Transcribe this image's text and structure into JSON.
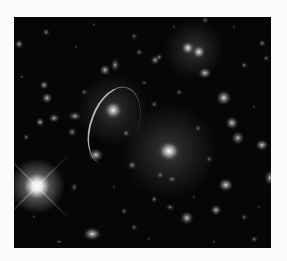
{
  "image": {
    "description": "Deep-field astronomical image of a galaxy cluster with gravitational lensing arc",
    "frame": {
      "x": 14,
      "y": 17,
      "width": 257,
      "height": 231,
      "border_color": "#fbfbfb",
      "background": "#060606"
    }
  },
  "bright_star": {
    "x": 23,
    "y": 169,
    "core": 7,
    "halo": 30,
    "spike_length": 46
  },
  "lensing_arc": {
    "x": 76,
    "y": 68,
    "width": 46,
    "height": 80,
    "rotate": 20
  },
  "large_glows": [
    {
      "x": 155,
      "y": 134,
      "r": 48,
      "alpha": 0.22
    },
    {
      "x": 99,
      "y": 93,
      "r": 36,
      "alpha": 0.2
    },
    {
      "x": 180,
      "y": 33,
      "r": 30,
      "alpha": 0.2
    }
  ],
  "galaxies": [
    {
      "x": 155,
      "y": 134,
      "w": 10,
      "h": 9,
      "b": 1.0
    },
    {
      "x": 99,
      "y": 93,
      "w": 8,
      "h": 8,
      "b": 0.95
    },
    {
      "x": 174,
      "y": 31,
      "w": 6,
      "h": 6,
      "b": 0.9
    },
    {
      "x": 185,
      "y": 35,
      "w": 6,
      "h": 6,
      "b": 0.9
    },
    {
      "x": 191,
      "y": 56,
      "w": 6,
      "h": 5,
      "b": 0.8
    },
    {
      "x": 210,
      "y": 81,
      "w": 7,
      "h": 7,
      "b": 0.85
    },
    {
      "x": 218,
      "y": 106,
      "w": 6,
      "h": 6,
      "b": 0.8
    },
    {
      "x": 224,
      "y": 121,
      "w": 6,
      "h": 6,
      "b": 0.75
    },
    {
      "x": 248,
      "y": 128,
      "w": 6,
      "h": 5,
      "b": 0.8
    },
    {
      "x": 212,
      "y": 168,
      "w": 7,
      "h": 6,
      "b": 0.85
    },
    {
      "x": 173,
      "y": 201,
      "w": 6,
      "h": 6,
      "b": 0.8
    },
    {
      "x": 202,
      "y": 193,
      "w": 5,
      "h": 5,
      "b": 0.75
    },
    {
      "x": 256,
      "y": 161,
      "w": 5,
      "h": 7,
      "b": 0.7
    },
    {
      "x": 78,
      "y": 217,
      "w": 8,
      "h": 6,
      "b": 0.85
    },
    {
      "x": 82,
      "y": 138,
      "w": 7,
      "h": 6,
      "b": 0.8
    },
    {
      "x": 40,
      "y": 101,
      "w": 5,
      "h": 4,
      "b": 0.7
    },
    {
      "x": 26,
      "y": 105,
      "w": 4,
      "h": 4,
      "b": 0.7
    },
    {
      "x": 61,
      "y": 99,
      "w": 6,
      "h": 4,
      "b": 0.7
    },
    {
      "x": 58,
      "y": 115,
      "w": 4,
      "h": 4,
      "b": 0.6
    },
    {
      "x": 91,
      "y": 53,
      "w": 5,
      "h": 5,
      "b": 0.75
    },
    {
      "x": 101,
      "y": 48,
      "w": 4,
      "h": 6,
      "b": 0.65
    },
    {
      "x": 30,
      "y": 68,
      "w": 4,
      "h": 4,
      "b": 0.7
    },
    {
      "x": 33,
      "y": 81,
      "w": 5,
      "h": 5,
      "b": 0.75
    },
    {
      "x": 5,
      "y": 27,
      "w": 4,
      "h": 4,
      "b": 0.7
    },
    {
      "x": 32,
      "y": 15,
      "w": 3,
      "h": 3,
      "b": 0.6
    },
    {
      "x": 141,
      "y": 43,
      "w": 4,
      "h": 4,
      "b": 0.7
    },
    {
      "x": 145,
      "y": 40,
      "w": 3,
      "h": 3,
      "b": 0.6
    },
    {
      "x": 125,
      "y": 35,
      "w": 3,
      "h": 3,
      "b": 0.55
    },
    {
      "x": 120,
      "y": 19,
      "w": 3,
      "h": 3,
      "b": 0.5
    },
    {
      "x": 191,
      "y": 3,
      "w": 3,
      "h": 3,
      "b": 0.5
    },
    {
      "x": 112,
      "y": 116,
      "w": 3,
      "h": 3,
      "b": 0.6
    },
    {
      "x": 118,
      "y": 148,
      "w": 4,
      "h": 4,
      "b": 0.6
    },
    {
      "x": 146,
      "y": 158,
      "w": 3,
      "h": 3,
      "b": 0.55
    },
    {
      "x": 158,
      "y": 162,
      "w": 4,
      "h": 3,
      "b": 0.55
    },
    {
      "x": 140,
      "y": 182,
      "w": 3,
      "h": 3,
      "b": 0.55
    },
    {
      "x": 156,
      "y": 190,
      "w": 4,
      "h": 3,
      "b": 0.55
    },
    {
      "x": 230,
      "y": 48,
      "w": 3,
      "h": 3,
      "b": 0.55
    },
    {
      "x": 248,
      "y": 26,
      "w": 3,
      "h": 3,
      "b": 0.6
    },
    {
      "x": 252,
      "y": 41,
      "w": 3,
      "h": 3,
      "b": 0.5
    },
    {
      "x": 165,
      "y": 75,
      "w": 3,
      "h": 3,
      "b": 0.5
    },
    {
      "x": 140,
      "y": 87,
      "w": 3,
      "h": 3,
      "b": 0.5
    },
    {
      "x": 130,
      "y": 66,
      "w": 3,
      "h": 2,
      "b": 0.5
    },
    {
      "x": 60,
      "y": 170,
      "w": 3,
      "h": 4,
      "b": 0.5
    },
    {
      "x": 110,
      "y": 194,
      "w": 3,
      "h": 3,
      "b": 0.5
    },
    {
      "x": 120,
      "y": 210,
      "w": 3,
      "h": 3,
      "b": 0.5
    },
    {
      "x": 45,
      "y": 225,
      "w": 3,
      "h": 2,
      "b": 0.5
    },
    {
      "x": 240,
      "y": 222,
      "w": 3,
      "h": 3,
      "b": 0.55
    },
    {
      "x": 230,
      "y": 200,
      "w": 3,
      "h": 3,
      "b": 0.5
    },
    {
      "x": 184,
      "y": 111,
      "w": 3,
      "h": 3,
      "b": 0.5
    },
    {
      "x": 195,
      "y": 142,
      "w": 3,
      "h": 3,
      "b": 0.5
    },
    {
      "x": 70,
      "y": 75,
      "w": 3,
      "h": 3,
      "b": 0.5
    },
    {
      "x": 12,
      "y": 120,
      "w": 3,
      "h": 3,
      "b": 0.5
    },
    {
      "x": 8,
      "y": 60,
      "w": 2,
      "h": 2,
      "b": 0.5
    },
    {
      "x": 62,
      "y": 30,
      "w": 2,
      "h": 2,
      "b": 0.45
    },
    {
      "x": 80,
      "y": 8,
      "w": 2,
      "h": 2,
      "b": 0.45
    },
    {
      "x": 160,
      "y": 10,
      "w": 2,
      "h": 2,
      "b": 0.45
    },
    {
      "x": 220,
      "y": 10,
      "w": 2,
      "h": 2,
      "b": 0.45
    },
    {
      "x": 100,
      "y": 170,
      "w": 2,
      "h": 2,
      "b": 0.45
    },
    {
      "x": 180,
      "y": 180,
      "w": 2,
      "h": 2,
      "b": 0.45
    },
    {
      "x": 240,
      "y": 90,
      "w": 2,
      "h": 2,
      "b": 0.45
    },
    {
      "x": 245,
      "y": 190,
      "w": 2,
      "h": 2,
      "b": 0.45
    },
    {
      "x": 20,
      "y": 200,
      "w": 2,
      "h": 2,
      "b": 0.45
    },
    {
      "x": 135,
      "y": 222,
      "w": 2,
      "h": 2,
      "b": 0.45
    },
    {
      "x": 200,
      "y": 225,
      "w": 2,
      "h": 2,
      "b": 0.45
    }
  ]
}
